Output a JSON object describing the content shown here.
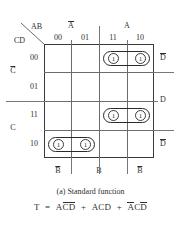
{
  "figure": {
    "corner": {
      "top_label": "AB",
      "bottom_label": "CD"
    },
    "caption": "(a)  Standard function",
    "equation": {
      "lhs": "T",
      "equals": "=",
      "plus": "+",
      "terms": [
        {
          "parts": [
            {
              "t": "A",
              "bar": false
            },
            {
              "t": "C",
              "bar": true
            },
            {
              "t": "D",
              "bar": true
            }
          ]
        },
        {
          "parts": [
            {
              "t": "A",
              "bar": false
            },
            {
              "t": "C",
              "bar": false
            },
            {
              "t": "D",
              "bar": false
            }
          ]
        },
        {
          "parts": [
            {
              "t": "A",
              "bar": true
            },
            {
              "t": "C",
              "bar": false
            },
            {
              "t": "D",
              "bar": true
            }
          ]
        }
      ],
      "plain": "T = AC̄D̄ + ACD + ĀCD̄"
    },
    "column_headers": [
      "00",
      "01",
      "11",
      "10"
    ],
    "row_headers": [
      "00",
      "01",
      "11",
      "10"
    ],
    "top_groups": [
      {
        "label": "A",
        "bar": true,
        "spans": [
          "00",
          "01"
        ]
      },
      {
        "label": "A",
        "bar": false,
        "spans": [
          "11",
          "10"
        ]
      }
    ],
    "left_groups": [
      {
        "label": "C",
        "bar": true,
        "spans": [
          "00",
          "01"
        ]
      },
      {
        "label": "C",
        "bar": false,
        "spans": [
          "11",
          "10"
        ]
      }
    ],
    "right_groups": [
      {
        "label": "D",
        "bar": true,
        "spans": [
          "00"
        ]
      },
      {
        "label": "D",
        "bar": false,
        "spans": [
          "01",
          "11"
        ]
      },
      {
        "label": "D",
        "bar": true,
        "spans": [
          "10"
        ]
      }
    ],
    "bottom_groups": [
      {
        "label": "B",
        "bar": true,
        "spans": [
          "00"
        ]
      },
      {
        "label": "B",
        "bar": false,
        "spans": [
          "01",
          "11"
        ]
      },
      {
        "label": "B",
        "bar": true,
        "spans": [
          "10"
        ]
      }
    ],
    "cells": [
      {
        "row": "00",
        "col": "11",
        "value": "1"
      },
      {
        "row": "00",
        "col": "10",
        "value": "1"
      },
      {
        "row": "11",
        "col": "11",
        "value": "1"
      },
      {
        "row": "11",
        "col": "10",
        "value": "1"
      },
      {
        "row": "10",
        "col": "00",
        "value": "1"
      },
      {
        "row": "10",
        "col": "01",
        "value": "1"
      }
    ],
    "groupings": [
      {
        "name": "group-acd-bar",
        "row": "00",
        "cols": [
          "11",
          "10"
        ]
      },
      {
        "name": "group-acd",
        "row": "11",
        "cols": [
          "11",
          "10"
        ]
      },
      {
        "name": "group-a-bar-cd-bar",
        "row": "10",
        "cols": [
          "00",
          "01"
        ]
      }
    ]
  },
  "colors": {
    "ink": "#2f2f2f",
    "grid_line": "#6b6b6b",
    "grid_border": "#3a3a3a",
    "oval": "#2b2b2b",
    "background": "#ffffff"
  }
}
